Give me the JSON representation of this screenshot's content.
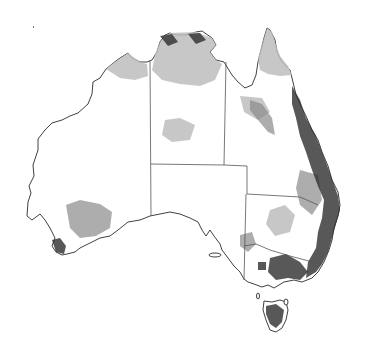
{
  "map": {
    "subject": "Australia",
    "style": "grayscale density map with state boundaries",
    "colors": {
      "background": "#ffffff",
      "coastline": "#2a2a2a",
      "state_border": "#555555",
      "low_density": "#bdbdbd",
      "medium_density": "#8a8a8a",
      "high_density": "#2e2e2e"
    },
    "regions": [
      {
        "name": "Western Australia"
      },
      {
        "name": "Northern Territory"
      },
      {
        "name": "South Australia"
      },
      {
        "name": "Queensland"
      },
      {
        "name": "New South Wales"
      },
      {
        "name": "Victoria"
      },
      {
        "name": "Tasmania"
      }
    ],
    "shaded_areas": [
      {
        "area": "Top End (NT north)",
        "level": "low"
      },
      {
        "area": "Cape York Peninsula",
        "level": "low"
      },
      {
        "area": "East coast QLD/NSW",
        "level": "high"
      },
      {
        "area": "Southern Victoria",
        "level": "high"
      },
      {
        "area": "Tasmania",
        "level": "high"
      },
      {
        "area": "Southwest WA",
        "level": "medium"
      },
      {
        "area": "Kimberley coast",
        "level": "low"
      }
    ]
  }
}
